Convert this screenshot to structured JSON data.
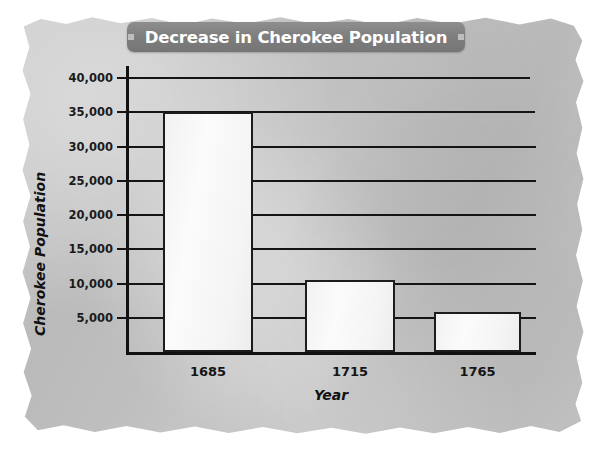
{
  "banner": {
    "title": "Decrease in Cherokee Population",
    "bullet_left": "square-bullet",
    "bullet_right": "square-bullet",
    "background_color": "#7e7e7e",
    "text_color": "#ffffff"
  },
  "paper": {
    "color": "#c6c6c6",
    "style": "torn-edge-parchment"
  },
  "chart_data": {
    "type": "bar",
    "title": "Decrease in Cherokee Population",
    "xlabel": "Year",
    "ylabel": "Cherokee Population",
    "categories": [
      "1685",
      "1715",
      "1765"
    ],
    "values": [
      35000,
      10500,
      5800
    ],
    "ylim": [
      0,
      42000
    ],
    "yticks": [
      5000,
      10000,
      15000,
      20000,
      25000,
      30000,
      35000,
      40000
    ],
    "ytick_labels": [
      "5,000",
      "10,000",
      "15,000",
      "20,000",
      "25,000",
      "30,000",
      "35,000",
      "40,000"
    ],
    "grid": true,
    "grid_axis": "y",
    "legend": false,
    "bar_fill_color": "#f6f6f6",
    "bar_edge_color": "#1c1c1c",
    "axis_color": "#111111"
  }
}
